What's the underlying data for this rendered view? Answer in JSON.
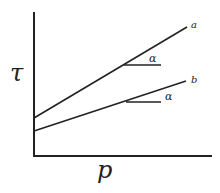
{
  "diagram": {
    "axes": {
      "y_label": "τ",
      "x_label": "p"
    },
    "lines": [
      {
        "id": "a",
        "label": "a",
        "x1": 34,
        "y1": 118,
        "x2": 187,
        "y2": 27
      },
      {
        "id": "b",
        "label": "b",
        "x1": 34,
        "y1": 131,
        "x2": 186,
        "y2": 81
      }
    ],
    "angles": [
      {
        "line": "a",
        "label": "α",
        "x1": 124,
        "y1": 65,
        "x2": 161,
        "y2": 65,
        "lx": 150,
        "ly": 61
      },
      {
        "line": "b",
        "label": "α",
        "x1": 126,
        "y1": 102,
        "x2": 161,
        "y2": 102,
        "lx": 166,
        "ly": 100
      }
    ],
    "colors": {
      "stroke": "#222222",
      "background": "#ffffff"
    }
  }
}
